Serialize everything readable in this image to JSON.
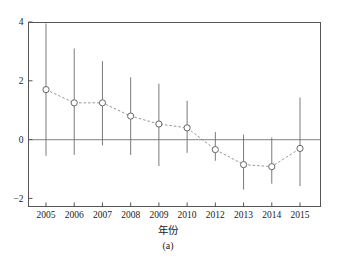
{
  "chart_data": {
    "type": "scatter",
    "title": "",
    "subtitle": "",
    "caption": "(a)",
    "xlabel": "年份",
    "ylabel": "",
    "grid": false,
    "legend": null,
    "categories": [
      "2005",
      "2006",
      "2007",
      "2008",
      "2009",
      "2010",
      "2012",
      "2013",
      "2014",
      "2015"
    ],
    "xtick_labels": [
      "2005",
      "2006",
      "2007",
      "2008",
      "2009",
      "2010",
      "2012",
      "2013",
      "2014",
      "2015"
    ],
    "ytick_labels": [
      "4",
      "2",
      "0",
      "−2"
    ],
    "yticks": [
      4,
      2,
      0,
      -2
    ],
    "ylim": [
      -2.4,
      4.2
    ],
    "zero_line": 0,
    "marker": "open-circle",
    "line_style": "dashed",
    "series": [
      {
        "name": "estimate",
        "values": [
          1.7,
          1.25,
          1.25,
          0.8,
          0.53,
          0.4,
          -0.34,
          -0.85,
          -0.92,
          -0.3
        ],
        "ci_low": [
          -0.55,
          -0.52,
          -0.2,
          -0.52,
          -0.9,
          -0.45,
          -0.72,
          -1.7,
          -1.5,
          -1.58
        ],
        "ci_high": [
          3.95,
          3.1,
          2.67,
          2.12,
          1.9,
          1.32,
          0.26,
          0.17,
          0.07,
          1.43
        ]
      }
    ],
    "colors": {
      "frame": "#555555",
      "marker": "#666666",
      "line": "#8a8a8a",
      "errorbar": "#6b6b6b",
      "zero_line": "#9a9a9a",
      "text": "#1a1a1a",
      "background": "#ffffff"
    }
  },
  "figure": {
    "axis_label": "年份",
    "panel_caption": "(a)"
  }
}
